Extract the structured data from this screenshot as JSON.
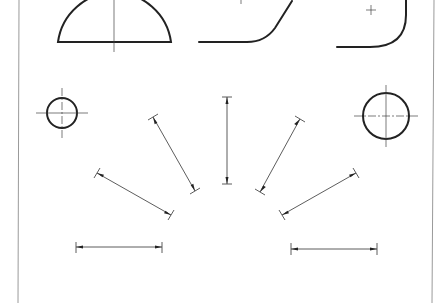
{
  "drawing": {
    "title": "",
    "colors": {
      "frame": "#9a9a9a",
      "outline": "#222222",
      "thin": "#333333"
    },
    "frame": {
      "left": 19,
      "right": 433,
      "top": 0,
      "bottom": 303
    },
    "shapes": [
      {
        "name": "semicircle",
        "type": "half-circle",
        "cx": 115,
        "cy": 42,
        "r": 57
      },
      {
        "name": "fillet-corner-left",
        "type": "fillet-line"
      },
      {
        "name": "fillet-corner-right",
        "type": "fillet-arc"
      },
      {
        "name": "small-circle",
        "cx": 62,
        "cy": 113,
        "r": 15
      },
      {
        "name": "large-circle",
        "cx": 386,
        "cy": 116,
        "r": 23
      }
    ],
    "dimension_lines": [
      {
        "name": "dim-horizontal-left",
        "x1": 76,
        "y1": 247,
        "x2": 162,
        "y2": 247
      },
      {
        "name": "dim-diagonal-left-low",
        "x1": 97,
        "y1": 173,
        "x2": 171,
        "y2": 215
      },
      {
        "name": "dim-diagonal-left-high",
        "x1": 153,
        "y1": 117,
        "x2": 195,
        "y2": 191
      },
      {
        "name": "dim-vertical-center",
        "x1": 227,
        "y1": 97,
        "x2": 227,
        "y2": 184
      },
      {
        "name": "dim-diagonal-right-high",
        "x1": 300,
        "y1": 119,
        "x2": 260,
        "y2": 192
      },
      {
        "name": "dim-diagonal-right-low",
        "x1": 356,
        "y1": 173,
        "x2": 282,
        "y2": 215
      },
      {
        "name": "dim-horizontal-right",
        "x1": 291,
        "y1": 249,
        "x2": 377,
        "y2": 249
      }
    ]
  }
}
